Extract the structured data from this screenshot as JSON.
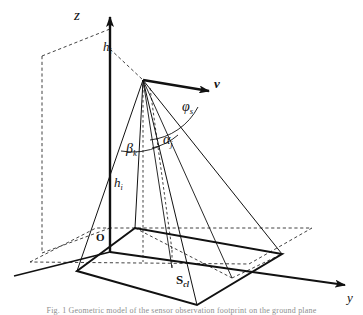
{
  "figure": {
    "kind": "geometry-diagram",
    "background_color": "#ffffff",
    "line_color": "#111111",
    "axes": {
      "z": {
        "label": "z",
        "direction": "up",
        "origin_label": "O"
      },
      "y": {
        "label": "y",
        "direction": "lower-right"
      },
      "origin": {
        "label": "O"
      }
    },
    "labels": {
      "z_axis": "z",
      "y_axis": "y",
      "origin": "O",
      "height_top": {
        "base": "h",
        "sub": "i"
      },
      "height_mid": {
        "base": "h",
        "sub": "i"
      },
      "velocity_vector": "v",
      "azimuth_angle": {
        "base": "φ",
        "sub": "s"
      },
      "alpha_angle": {
        "base": "α",
        "sub": "j"
      },
      "beta_angle": {
        "base": "β",
        "sub": "k"
      },
      "footprint_area": {
        "base": "S",
        "sub": "cl"
      }
    },
    "caption": "Fig. 1  Geometric model of the sensor observation footprint on the ground plane"
  }
}
